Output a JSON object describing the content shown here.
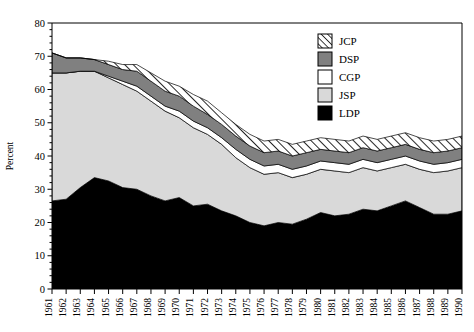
{
  "chart_data": {
    "type": "area",
    "stacked": true,
    "title": "",
    "subtitle": "",
    "xlabel": "",
    "ylabel": "Percent",
    "ylim": [
      0,
      80
    ],
    "ytick_values": [
      0,
      10,
      20,
      30,
      40,
      50,
      60,
      70,
      80
    ],
    "ytick_labels": [
      "0",
      "10",
      "20",
      "30",
      "40",
      "50",
      "60",
      "70",
      "80"
    ],
    "grid": false,
    "legend_position": "upper-right-inside",
    "categories": [
      "1961",
      "1962",
      "1963",
      "1964",
      "1965",
      "1966",
      "1967",
      "1968",
      "1969",
      "1970",
      "1971",
      "1972",
      "1973",
      "1974",
      "1975",
      "1976",
      "1977",
      "1978",
      "1979",
      "1980",
      "1981",
      "1982",
      "1983",
      "1984",
      "1985",
      "1986",
      "1987",
      "1988",
      "1989",
      "1990"
    ],
    "stack_order_bottom_to_top": [
      "LDP",
      "JSP",
      "CGP",
      "DSP",
      "JCP"
    ],
    "series": [
      {
        "name": "LDP",
        "fill": "#000000",
        "pattern": "solid",
        "values": [
          26.5,
          27.0,
          30.5,
          33.5,
          32.5,
          30.5,
          30.0,
          28.0,
          26.5,
          27.5,
          25.0,
          25.5,
          23.5,
          22.0,
          20.0,
          19.0,
          20.0,
          19.5,
          21.0,
          23.0,
          22.0,
          22.5,
          24.0,
          23.5,
          25.0,
          26.5,
          24.5,
          22.5,
          22.5,
          23.5
        ]
      },
      {
        "name": "JSP",
        "fill": "#d9d9d9",
        "pattern": "solid",
        "values": [
          38.5,
          38.0,
          35.0,
          32.0,
          31.0,
          31.0,
          29.5,
          28.5,
          27.0,
          24.0,
          23.5,
          21.0,
          20.0,
          17.5,
          16.5,
          15.5,
          15.0,
          14.0,
          13.5,
          13.0,
          13.5,
          12.5,
          12.5,
          12.0,
          11.5,
          11.0,
          11.5,
          12.5,
          13.0,
          13.0
        ]
      },
      {
        "name": "CGP",
        "fill": "#ffffff",
        "pattern": "solid",
        "values": [
          0.0,
          0.0,
          0.0,
          0.0,
          0.5,
          1.0,
          1.5,
          1.5,
          1.5,
          2.0,
          2.0,
          2.0,
          2.0,
          2.5,
          2.5,
          2.5,
          2.5,
          2.5,
          2.5,
          2.5,
          2.5,
          2.5,
          2.5,
          2.5,
          2.5,
          2.5,
          2.5,
          2.5,
          2.5,
          2.5
        ]
      },
      {
        "name": "DSP",
        "fill": "#808080",
        "pattern": "solid",
        "values": [
          6.0,
          4.5,
          4.0,
          3.5,
          3.5,
          3.5,
          4.5,
          4.5,
          4.5,
          4.5,
          4.5,
          4.0,
          4.0,
          4.0,
          4.0,
          4.0,
          4.0,
          4.0,
          4.0,
          3.5,
          3.5,
          3.5,
          3.5,
          3.5,
          3.5,
          3.5,
          3.5,
          3.5,
          3.5,
          3.5
        ]
      },
      {
        "name": "JCP",
        "fill": "#ffffff",
        "pattern": "diagonal-hatch",
        "values": [
          0.0,
          0.0,
          0.0,
          0.0,
          1.0,
          1.5,
          2.0,
          2.5,
          3.0,
          3.0,
          3.5,
          4.0,
          3.5,
          3.5,
          3.5,
          3.5,
          3.5,
          3.5,
          3.5,
          3.5,
          3.5,
          3.5,
          3.5,
          3.5,
          3.5,
          3.5,
          3.5,
          3.5,
          3.5,
          3.5
        ]
      }
    ],
    "totals": [
      71.0,
      69.5,
      69.5,
      69.0,
      68.5,
      67.5,
      67.5,
      65.0,
      62.5,
      61.0,
      58.5,
      56.5,
      53.0,
      49.5,
      46.5,
      44.5,
      45.0,
      43.5,
      44.5,
      45.5,
      45.0,
      44.5,
      46.0,
      45.0,
      46.0,
      47.0,
      45.5,
      44.5,
      45.0,
      46.0
    ]
  },
  "legend": {
    "items": [
      {
        "label": "JCP",
        "swatch": "hatch-swatch"
      },
      {
        "label": "DSP",
        "swatch": "gray-swatch"
      },
      {
        "label": "CGP",
        "swatch": "white-swatch"
      },
      {
        "label": "JSP",
        "swatch": "lightgray-swatch"
      },
      {
        "label": "LDP",
        "swatch": "black-swatch"
      }
    ]
  },
  "colors": {
    "ldp": "#000000",
    "jsp": "#d9d9d9",
    "cgp": "#ffffff",
    "dsp": "#808080",
    "jcp_hatch": "#000000",
    "axis": "#000000",
    "background": "#ffffff"
  }
}
